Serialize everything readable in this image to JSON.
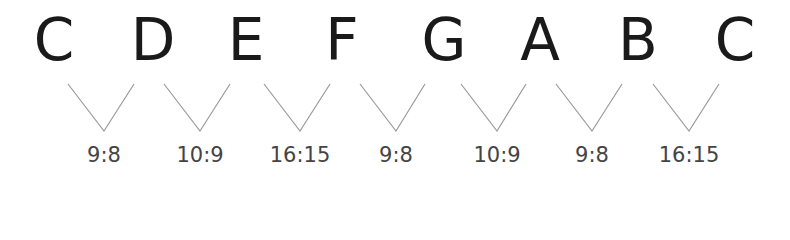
{
  "notes": [
    {
      "label": "C",
      "x": 54
    },
    {
      "label": "D",
      "x": 153
    },
    {
      "label": "E",
      "x": 246
    },
    {
      "label": "F",
      "x": 342
    },
    {
      "label": "G",
      "x": 444
    },
    {
      "label": "A",
      "x": 540
    },
    {
      "label": "B",
      "x": 638
    },
    {
      "label": "C",
      "x": 735
    }
  ],
  "intervals": [
    {
      "ratio": "9:8",
      "x": 104
    },
    {
      "ratio": "10:9",
      "x": 200
    },
    {
      "ratio": "16:15",
      "x": 300
    },
    {
      "ratio": "9:8",
      "x": 396
    },
    {
      "ratio": "10:9",
      "x": 497
    },
    {
      "ratio": "9:8",
      "x": 592
    },
    {
      "ratio": "16:15",
      "x": 689
    }
  ],
  "colors": {
    "note": "#1a1a1a",
    "ratio": "#444444",
    "line": "#9a9a9a"
  }
}
